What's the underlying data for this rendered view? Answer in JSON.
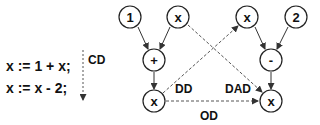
{
  "code": {
    "lines": [
      "x := 1 + x;",
      "x := x - 2;"
    ],
    "dependence_label": "CD"
  },
  "graph": {
    "nodes": [
      {
        "id": "n1",
        "label": "1"
      },
      {
        "id": "nx1",
        "label": "x"
      },
      {
        "id": "nplus",
        "label": "+"
      },
      {
        "id": "nxa",
        "label": "x"
      },
      {
        "id": "nx2",
        "label": "x"
      },
      {
        "id": "n2",
        "label": "2"
      },
      {
        "id": "nminus",
        "label": "-"
      },
      {
        "id": "nxb",
        "label": "x"
      }
    ],
    "edge_labels": {
      "dd": "DD",
      "dad": "DAD",
      "od": "OD"
    }
  }
}
